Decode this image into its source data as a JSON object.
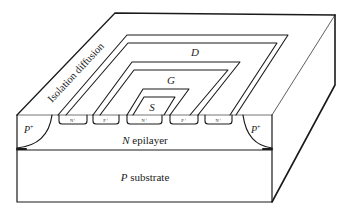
{
  "diagram": {
    "type": "cross-section-3d",
    "labels": {
      "isolation": "Isolation diffusion",
      "drain": "D",
      "gate": "G",
      "source": "S",
      "p_plus_left": "P",
      "p_plus_right": "P",
      "plus_sup": "+",
      "epilayer_letter": "N",
      "epilayer_word": " epilayer",
      "substrate_letter": "P",
      "substrate_word": " substrate"
    },
    "diffusions": [
      {
        "label": "N⁺"
      },
      {
        "label": "P⁺"
      },
      {
        "label": "N⁺"
      },
      {
        "label": "P⁺"
      },
      {
        "label": "N⁺"
      }
    ],
    "colors": {
      "stroke": "#1a1a1a",
      "background": "#ffffff"
    }
  }
}
